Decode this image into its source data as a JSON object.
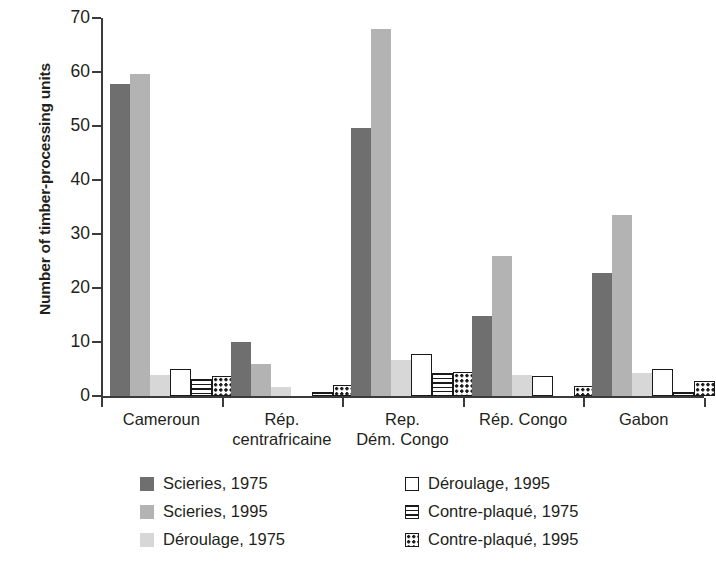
{
  "chart_data": {
    "type": "bar",
    "title": "",
    "xlabel": "",
    "ylabel": "Number of timber-processing units",
    "ylim": [
      0,
      70
    ],
    "yticks": [
      0,
      10,
      20,
      30,
      40,
      50,
      60,
      70
    ],
    "grid": false,
    "legend_position": "bottom",
    "categories": [
      "Cameroun",
      "Rép. centrafricaine",
      "Rep. Dém. Congo",
      "Rép. Congo",
      "Gabon"
    ],
    "series": [
      {
        "name": "Scieries, 1975",
        "key": "s1975",
        "color": "#706f6f",
        "pattern": "solid",
        "values": [
          57.7,
          10.0,
          49.7,
          14.8,
          22.7
        ]
      },
      {
        "name": "Scieries, 1995",
        "key": "s1995",
        "color": "#b4b3b3",
        "pattern": "solid",
        "values": [
          59.7,
          6.0,
          68.0,
          25.9,
          33.6
        ]
      },
      {
        "name": "Déroulage, 1975",
        "key": "d1975",
        "color": "#d8d7d7",
        "pattern": "solid",
        "values": [
          3.8,
          1.6,
          6.6,
          3.8,
          4.3
        ]
      },
      {
        "name": "Déroulage, 1995",
        "key": "d1995",
        "color": "#ffffff",
        "pattern": "outline",
        "values": [
          5.0,
          0.0,
          7.8,
          3.7,
          5.0
        ]
      },
      {
        "name": "Contre-plaqué, 1975",
        "key": "c1975",
        "color": "#ffffff",
        "pattern": "hlines",
        "values": [
          3.2,
          0.8,
          4.2,
          0.0,
          0.7
        ]
      },
      {
        "name": "Contre-plaqué, 1995",
        "key": "c1995",
        "color": "#ffffff",
        "pattern": "dots",
        "values": [
          3.7,
          2.0,
          4.4,
          1.9,
          2.8
        ]
      }
    ]
  },
  "axis": {
    "y_title": "Number of timber-processing units",
    "y_tick_labels": [
      "70",
      "60",
      "50",
      "40",
      "30",
      "20",
      "10",
      "0"
    ],
    "x_tick_labels": [
      {
        "line1": "Cameroun",
        "line2": ""
      },
      {
        "line1": "Rép.",
        "line2": "centrafricaine"
      },
      {
        "line1": "Rep.",
        "line2": "Dém. Congo"
      },
      {
        "line1": "Rép. Congo",
        "line2": ""
      },
      {
        "line1": "Gabon",
        "line2": ""
      }
    ]
  },
  "legend": {
    "items": [
      {
        "label": "Scieries, 1975",
        "swatch": "solid-dark-gray-swatch"
      },
      {
        "label": "Scieries, 1995",
        "swatch": "solid-mid-gray-swatch"
      },
      {
        "label": "Déroulage, 1975",
        "swatch": "solid-light-gray-swatch"
      },
      {
        "label": "Déroulage, 1995",
        "swatch": "outline-white-swatch"
      },
      {
        "label": "Contre-plaqué, 1975",
        "swatch": "horizontal-lines-swatch"
      },
      {
        "label": "Contre-plaqué, 1995",
        "swatch": "dotted-swatch"
      }
    ]
  },
  "colors": {
    "scieries_1975": "#706f6f",
    "scieries_1995": "#b4b3b3",
    "deroulage_1975": "#d8d7d7",
    "outline": "#1a1a1a",
    "axis": "#3b3b3b",
    "text": "#231f20",
    "background": "#ffffff"
  }
}
